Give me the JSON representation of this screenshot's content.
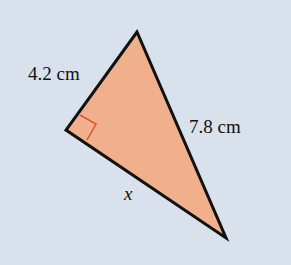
{
  "diagram": {
    "type": "right-triangle",
    "colors": {
      "background": "#d9e2ec",
      "fill": "#f0b08c",
      "stroke": "#111111",
      "right_angle_marker": "#e0503a"
    },
    "vertices": {
      "top": [
        137,
        32
      ],
      "right_angle": [
        66,
        130
      ],
      "bottom": [
        226,
        238
      ]
    },
    "labels": {
      "leg_short": "4.2 cm",
      "hypotenuse": "7.8 cm",
      "leg_long": "x"
    }
  }
}
